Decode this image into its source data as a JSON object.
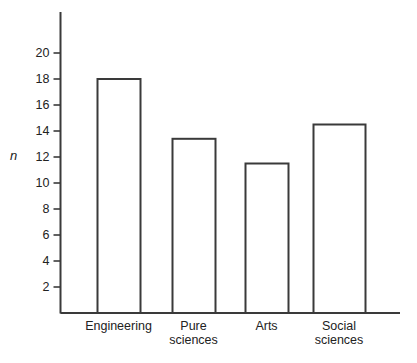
{
  "chart_data": {
    "type": "bar",
    "title": "",
    "subtitle": "",
    "xlabel": "",
    "ylabel": "n",
    "categories": [
      "Engineering",
      "Pure\nsciences",
      "Arts",
      "Social\nsciences"
    ],
    "values": [
      18.0,
      13.4,
      11.5,
      14.5
    ],
    "ylim": [
      0,
      21
    ],
    "yticks": [
      2,
      4,
      6,
      8,
      10,
      12,
      14,
      16,
      18,
      20
    ],
    "ytick_labels": [
      "2",
      "4",
      "6",
      "8",
      "10",
      "12",
      "14",
      "16",
      "18",
      "20"
    ],
    "grid": false,
    "legend": false,
    "legend_position": "none",
    "bar_fill_color": "#ffffff",
    "bar_edge_color": "#3a3a3a",
    "axis_color": "#3a3a3a"
  },
  "axis": {
    "y_label": "n",
    "ticks": [
      {
        "value": 20,
        "label": "20"
      },
      {
        "value": 18,
        "label": "18"
      },
      {
        "value": 16,
        "label": "16"
      },
      {
        "value": 14,
        "label": "14"
      },
      {
        "value": 12,
        "label": "12"
      },
      {
        "value": 10,
        "label": "10"
      },
      {
        "value": 8,
        "label": "8"
      },
      {
        "value": 6,
        "label": "6"
      },
      {
        "value": 4,
        "label": "4"
      },
      {
        "value": 2,
        "label": "2"
      }
    ]
  },
  "bars": [
    {
      "label": "Engineering",
      "value": 18.0
    },
    {
      "label": "Pure\nsciences",
      "value": 13.4
    },
    {
      "label": "Arts",
      "value": 11.5
    },
    {
      "label": "Social\nsciences",
      "value": 14.5
    }
  ]
}
